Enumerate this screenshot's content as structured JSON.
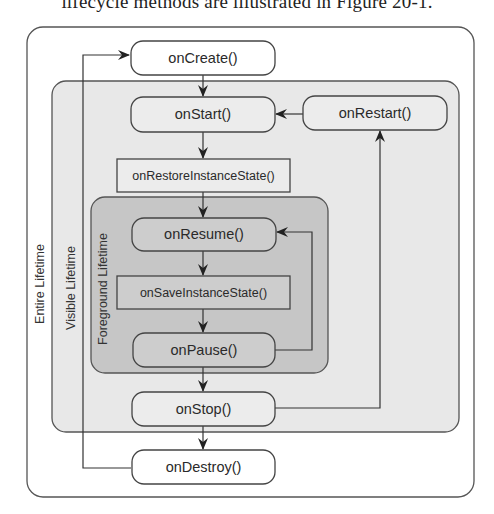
{
  "caption": "lifecycle methods are illustrated in Figure 20-1.",
  "diagram": {
    "regions": {
      "entire": {
        "label": "Entire Lifetime",
        "fill": "#ffffff"
      },
      "visible": {
        "label": "Visible Lifetime",
        "fill": "#e8e8e8"
      },
      "foreground": {
        "label": "Foreground Lifetime",
        "fill": "#c6c6c6"
      }
    },
    "nodes": {
      "onCreate": "onCreate()",
      "onStart": "onStart()",
      "onRestart": "onRestart()",
      "onRestoreInstanceState": "onRestoreInstanceState()",
      "onResume": "onResume()",
      "onSaveInstanceState": "onSaveInstanceState()",
      "onPause": "onPause()",
      "onStop": "onStop()",
      "onDestroy": "onDestroy()"
    },
    "edges": [
      {
        "from": "onCreate",
        "to": "onStart"
      },
      {
        "from": "onStart",
        "to": "onRestoreInstanceState"
      },
      {
        "from": "onRestoreInstanceState",
        "to": "onResume"
      },
      {
        "from": "onResume",
        "to": "onSaveInstanceState"
      },
      {
        "from": "onSaveInstanceState",
        "to": "onPause"
      },
      {
        "from": "onPause",
        "to": "onResume"
      },
      {
        "from": "onPause",
        "to": "onStop"
      },
      {
        "from": "onStop",
        "to": "onRestart"
      },
      {
        "from": "onRestart",
        "to": "onStart"
      },
      {
        "from": "onStop",
        "to": "onDestroy"
      },
      {
        "from": "onDestroy",
        "to": "onCreate"
      }
    ]
  }
}
